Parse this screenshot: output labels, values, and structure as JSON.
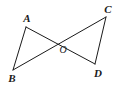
{
  "figure": {
    "background_color": "#ffffff",
    "stroke_color": "#1a1a1a",
    "label_color": "#1a1a1a",
    "stroke_width": 1,
    "width": 120,
    "height": 88,
    "points": [
      {
        "id": "A",
        "label": "A",
        "x": 26,
        "y": 27,
        "label_x": 27,
        "label_y": 18
      },
      {
        "id": "B",
        "label": "B",
        "x": 13,
        "y": 70,
        "label_x": 12,
        "label_y": 78
      },
      {
        "id": "C",
        "label": "C",
        "x": 106,
        "y": 17,
        "label_x": 108,
        "label_y": 9
      },
      {
        "id": "D",
        "label": "D",
        "x": 95,
        "y": 64,
        "label_x": 98,
        "label_y": 73
      },
      {
        "id": "O",
        "label": "O",
        "x": 62,
        "y": 43,
        "label_x": 63,
        "label_y": 50
      }
    ],
    "segments": [
      {
        "id": "AB",
        "from": "A",
        "to": "B",
        "x1": 26,
        "y1": 27,
        "x2": 13,
        "y2": 70
      },
      {
        "id": "AD",
        "from": "A",
        "to": "D",
        "x1": 26,
        "y1": 27,
        "x2": 95,
        "y2": 64
      },
      {
        "id": "BC",
        "from": "B",
        "to": "C",
        "x1": 13,
        "y1": 70,
        "x2": 106,
        "y2": 17
      },
      {
        "id": "CD",
        "from": "C",
        "to": "D",
        "x1": 106,
        "y1": 17,
        "x2": 95,
        "y2": 64
      }
    ]
  }
}
